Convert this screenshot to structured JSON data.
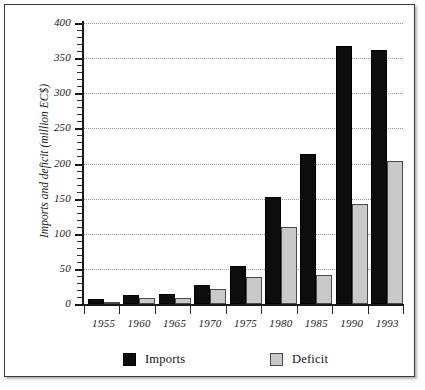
{
  "chart_data": {
    "type": "bar",
    "title": "",
    "subtitle": "",
    "xlabel": "",
    "ylabel": "Imports and deficit (million EC$)",
    "ylim": [
      0,
      400
    ],
    "ytick_step": 50,
    "yminor_step": 10,
    "grid": "horizontal-dotted",
    "legend_position": "bottom",
    "categories": [
      "1955",
      "1960",
      "1965",
      "1970",
      "1975",
      "1980",
      "1985",
      "1990",
      "1993"
    ],
    "yticks": [
      "0",
      "50",
      "100",
      "150",
      "200",
      "250",
      "300",
      "350",
      "400"
    ],
    "series": [
      {
        "name": "Imports",
        "color": "#0d0d0d",
        "values": [
          7,
          13,
          14,
          27,
          54,
          153,
          213,
          367,
          361
        ]
      },
      {
        "name": "Deficit",
        "color": "#c9c9c9",
        "values": [
          2,
          8,
          8,
          22,
          38,
          110,
          42,
          142,
          204
        ]
      }
    ]
  },
  "legend": {
    "imports_label": "Imports",
    "deficit_label": "Deficit"
  },
  "axes": {
    "y_title": "Imports and deficit (million EC$)"
  }
}
